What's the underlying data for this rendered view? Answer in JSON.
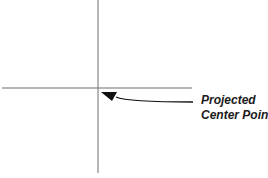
{
  "diagram": {
    "label_line1": "Projected",
    "label_line2": "Center Point",
    "colors": {
      "line": "#6e6e6e",
      "arrow": "#111111",
      "background": "#ffffff"
    },
    "elements": {
      "vertical_axis": {
        "x": 98,
        "y1": 0,
        "y2": 173
      },
      "horizontal_axis": {
        "y": 88,
        "x1": 2,
        "x2": 192
      },
      "center_point": {
        "x": 98,
        "y": 88
      },
      "arrow": {
        "from": [
          193,
          102
        ],
        "to": [
          101,
          92
        ]
      }
    }
  }
}
